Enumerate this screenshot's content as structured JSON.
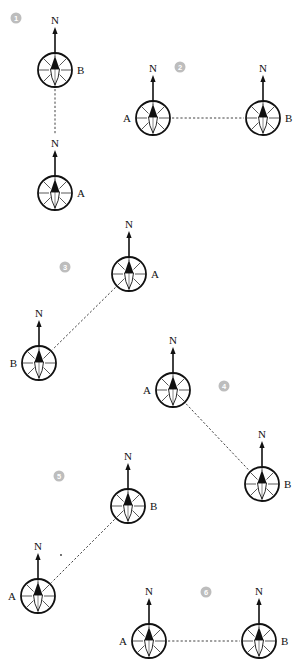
{
  "figure": {
    "north_label": "N",
    "colors": {
      "ink": "#111111",
      "badge": "#bdbdbd",
      "badge_text": "#ffffff",
      "background": "#ffffff"
    },
    "panels": [
      {
        "number": "1",
        "badge": {
          "x": 16,
          "y": 18
        },
        "compasses": [
          {
            "label": "B",
            "x": 55,
            "y": 70,
            "label_side": "right"
          },
          {
            "label": "A",
            "x": 55,
            "y": 193,
            "label_side": "right"
          }
        ],
        "line": "vertical"
      },
      {
        "number": "2",
        "badge": {
          "x": 180,
          "y": 67
        },
        "compasses": [
          {
            "label": "A",
            "x": 153,
            "y": 118,
            "label_side": "left"
          },
          {
            "label": "B",
            "x": 263,
            "y": 118,
            "label_side": "right"
          }
        ],
        "line": "horizontal"
      },
      {
        "number": "3",
        "badge": {
          "x": 65,
          "y": 267
        },
        "compasses": [
          {
            "label": "A",
            "x": 129,
            "y": 274,
            "label_side": "right"
          },
          {
            "label": "B",
            "x": 39,
            "y": 363,
            "label_side": "left"
          }
        ],
        "line": "diagonal"
      },
      {
        "number": "4",
        "badge": {
          "x": 224,
          "y": 386
        },
        "compasses": [
          {
            "label": "A",
            "x": 173,
            "y": 390,
            "label_side": "left"
          },
          {
            "label": "B",
            "x": 262,
            "y": 484,
            "label_side": "right"
          }
        ],
        "line": "diagonal"
      },
      {
        "number": "5",
        "badge": {
          "x": 59,
          "y": 476
        },
        "compasses": [
          {
            "label": "B",
            "x": 128,
            "y": 506,
            "label_side": "right"
          },
          {
            "label": "A",
            "x": 38,
            "y": 596,
            "label_side": "left"
          }
        ],
        "line": "diagonal"
      },
      {
        "number": "6",
        "badge": {
          "x": 206,
          "y": 592
        },
        "compasses": [
          {
            "label": "A",
            "x": 149,
            "y": 641,
            "label_side": "left"
          },
          {
            "label": "B",
            "x": 259,
            "y": 641,
            "label_side": "right"
          }
        ],
        "line": "horizontal"
      }
    ]
  }
}
